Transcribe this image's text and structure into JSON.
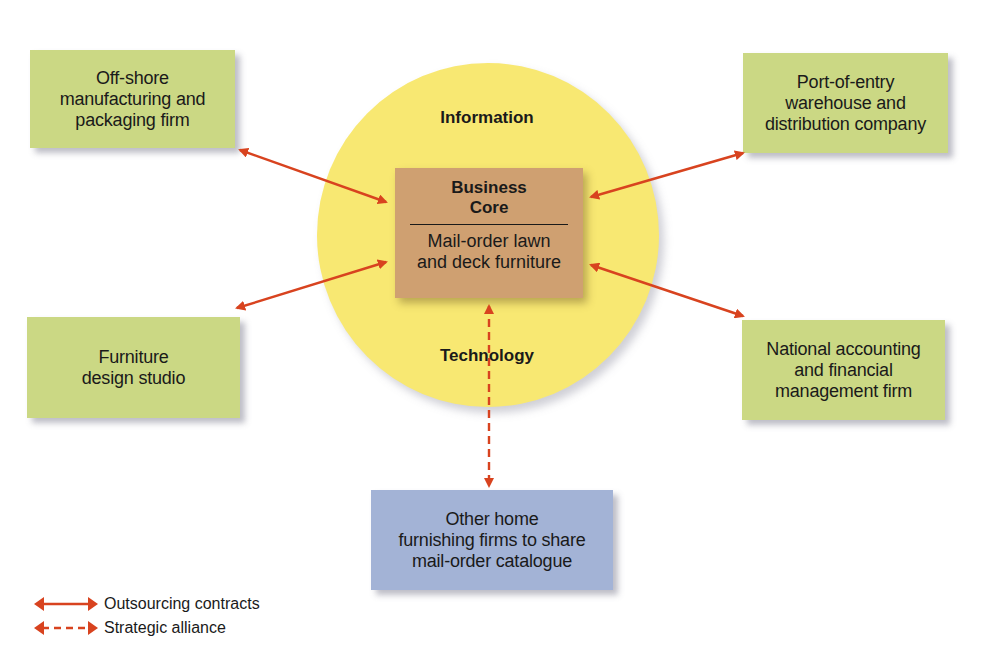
{
  "diagram": {
    "center": {
      "outer_labels": {
        "top": "Information",
        "bottom": "Technology"
      },
      "core": {
        "title": "Business\nCore",
        "subtitle": "Mail-order lawn\nand deck furniture"
      }
    },
    "partners": [
      {
        "id": "offshore",
        "label": "Off-shore\nmanufacturing and\npackaging firm",
        "relation": "Outsourcing contracts"
      },
      {
        "id": "port",
        "label": "Port-of-entry\nwarehouse and\ndistribution company",
        "relation": "Outsourcing contracts"
      },
      {
        "id": "design",
        "label": "Furniture\ndesign studio",
        "relation": "Outsourcing contracts"
      },
      {
        "id": "accounting",
        "label": "National accounting\nand financial\nmanagement firm",
        "relation": "Outsourcing contracts"
      },
      {
        "id": "other-home",
        "label": "Other home\nfurnishing firms to share\n mail-order catalogue",
        "relation": "Strategic alliance"
      }
    ],
    "legend": [
      {
        "style": "solid",
        "label": "Outsourcing contracts"
      },
      {
        "style": "dashed",
        "label": "Strategic alliance"
      }
    ],
    "colors": {
      "circle": "#f8e872",
      "core": "#cfa071",
      "partner_green": "#cbd884",
      "partner_blue": "#a3b3d6",
      "arrow": "#d8431f"
    }
  }
}
